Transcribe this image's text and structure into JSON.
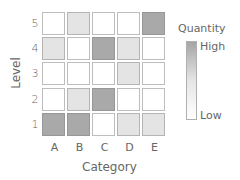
{
  "chart_data": {
    "type": "heatmap",
    "title": "",
    "xlabel": "Category",
    "ylabel": "Level",
    "x_categories": [
      "A",
      "B",
      "C",
      "D",
      "E"
    ],
    "y_categories": [
      "1",
      "2",
      "3",
      "4",
      "5"
    ],
    "scale": {
      "0": "none/low (white)",
      "1": "medium (light grey)",
      "2": "high (dark grey)"
    },
    "values_by_level": {
      "5": [
        0,
        1,
        0,
        0,
        2
      ],
      "4": [
        1,
        0,
        2,
        1,
        0
      ],
      "3": [
        0,
        0,
        0,
        1,
        0
      ],
      "2": [
        0,
        1,
        2,
        0,
        0
      ],
      "1": [
        2,
        2,
        0,
        1,
        1
      ]
    },
    "legend": {
      "title": "Quantity",
      "high_label": "High",
      "low_label": "Low",
      "high_color": "#a5a5a5",
      "low_color": "#ffffff"
    },
    "grid": false
  },
  "axes": {
    "xlabel": "Category",
    "ylabel": "Level",
    "xticks": [
      "A",
      "B",
      "C",
      "D",
      "E"
    ],
    "yticks": [
      "5",
      "4",
      "3",
      "2",
      "1"
    ]
  },
  "legend": {
    "title": "Quantity",
    "high": "High",
    "low": "Low"
  },
  "colors": {
    "level0": "#ffffff",
    "level1": "#e4e4e4",
    "level2": "#a9a9a9"
  }
}
